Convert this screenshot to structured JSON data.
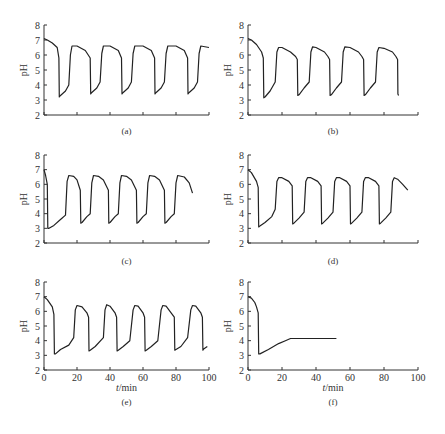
{
  "figure": {
    "panels": [
      "(a)",
      "(b)",
      "(c)",
      "(d)",
      "(e)",
      "(f)"
    ]
  },
  "chart_data": [
    {
      "panel": "(a)",
      "type": "line",
      "title": "",
      "xlabel": "",
      "ylabel": "pH",
      "xlim": [
        0,
        100
      ],
      "ylim": [
        2,
        8
      ],
      "yticks": [
        2,
        3,
        4,
        5,
        6,
        7,
        8
      ],
      "xticks": [
        0,
        20,
        40,
        60,
        80,
        100
      ],
      "xtick_labels_shown": false,
      "layout": {
        "x0": 44,
        "y0": 115,
        "xw": 165,
        "yh": 90,
        "cap_y": 134
      },
      "x": [
        0,
        2,
        5,
        8,
        9,
        9.3,
        10,
        13,
        15,
        16,
        17,
        20,
        25,
        28,
        28.3,
        29,
        32,
        34,
        35,
        36,
        40,
        45,
        47,
        47.3,
        48,
        51,
        53,
        54,
        55,
        60,
        65,
        67,
        67.3,
        68,
        71,
        73,
        74,
        75,
        80,
        85,
        87,
        87.3,
        88,
        91,
        93,
        94,
        95,
        100
      ],
      "values": [
        7.1,
        7.0,
        6.8,
        6.5,
        5.8,
        3.2,
        3.3,
        3.6,
        4.0,
        6.0,
        6.6,
        6.6,
        6.3,
        5.8,
        3.4,
        3.5,
        3.8,
        4.2,
        6.1,
        6.6,
        6.6,
        6.3,
        5.8,
        3.4,
        3.5,
        3.8,
        4.2,
        6.1,
        6.6,
        6.6,
        6.3,
        5.8,
        3.4,
        3.5,
        3.8,
        4.2,
        6.1,
        6.6,
        6.6,
        6.3,
        5.8,
        3.4,
        3.5,
        3.8,
        4.2,
        6.1,
        6.6,
        6.5
      ]
    },
    {
      "panel": "(b)",
      "type": "line",
      "title": "",
      "xlabel": "",
      "ylabel": "pH",
      "xlim": [
        0,
        100
      ],
      "ylim": [
        2,
        8
      ],
      "yticks": [
        2,
        3,
        4,
        5,
        6,
        7,
        8
      ],
      "xticks": [
        0,
        20,
        40,
        60,
        80,
        100
      ],
      "xtick_labels_shown": false,
      "layout": {
        "x0": 248,
        "y0": 115,
        "xw": 170,
        "yh": 90,
        "cap_y": 134
      },
      "x": [
        0,
        2,
        5,
        8,
        9,
        9.3,
        10,
        13,
        16,
        17,
        18,
        20,
        25,
        28,
        29,
        29.3,
        30,
        33,
        36,
        37,
        38,
        40,
        45,
        47,
        48,
        48.3,
        49,
        52,
        55,
        56,
        57,
        60,
        65,
        67,
        68,
        68.3,
        69,
        72,
        75,
        76,
        77,
        80,
        85,
        87,
        88,
        88.2,
        88.6
      ],
      "values": [
        7.1,
        7.0,
        6.7,
        6.2,
        5.8,
        3.15,
        3.2,
        3.6,
        4.2,
        6.2,
        6.5,
        6.5,
        6.2,
        5.9,
        5.7,
        3.3,
        3.35,
        3.8,
        4.2,
        6.2,
        6.55,
        6.5,
        6.2,
        5.9,
        5.7,
        3.3,
        3.35,
        3.8,
        4.2,
        6.2,
        6.55,
        6.5,
        6.2,
        5.9,
        5.7,
        3.3,
        3.35,
        3.8,
        4.2,
        6.2,
        6.5,
        6.45,
        6.2,
        5.9,
        5.7,
        3.4,
        3.3
      ]
    },
    {
      "panel": "(c)",
      "type": "line",
      "title": "",
      "xlabel": "",
      "ylabel": "pH",
      "xlim": [
        0,
        100
      ],
      "ylim": [
        2,
        8
      ],
      "yticks": [
        2,
        3,
        4,
        5,
        6,
        7,
        8
      ],
      "xticks": [
        0,
        20,
        40,
        60,
        80,
        100
      ],
      "xtick_labels_shown": false,
      "layout": {
        "x0": 44,
        "y0": 243,
        "xw": 165,
        "yh": 88,
        "cap_y": 264
      },
      "x": [
        0,
        1,
        2,
        2.3,
        3,
        6,
        10,
        13,
        14,
        15,
        18,
        20,
        22,
        22.3,
        23,
        26,
        28,
        29,
        30,
        33,
        36,
        39,
        39.3,
        40,
        43,
        45,
        46,
        47,
        50,
        53,
        56,
        56.3,
        57,
        60,
        62,
        63,
        64,
        67,
        70,
        73,
        73.3,
        74,
        77,
        79,
        80,
        81,
        85,
        88,
        90
      ],
      "values": [
        7.0,
        6.6,
        6.0,
        3.0,
        3.0,
        3.2,
        3.6,
        3.9,
        6.2,
        6.6,
        6.55,
        6.3,
        5.6,
        3.35,
        3.4,
        3.8,
        4.0,
        6.1,
        6.6,
        6.55,
        6.3,
        5.6,
        3.35,
        3.4,
        3.8,
        4.0,
        6.1,
        6.6,
        6.55,
        6.3,
        5.6,
        3.35,
        3.4,
        3.8,
        4.0,
        6.1,
        6.6,
        6.55,
        6.3,
        5.6,
        3.35,
        3.4,
        3.8,
        4.0,
        6.1,
        6.6,
        6.5,
        6.1,
        5.4
      ]
    },
    {
      "panel": "(d)",
      "type": "line",
      "title": "",
      "xlabel": "",
      "ylabel": "pH",
      "xlim": [
        0,
        100
      ],
      "ylim": [
        2,
        8
      ],
      "yticks": [
        2,
        3,
        4,
        5,
        6,
        7,
        8
      ],
      "xticks": [
        0,
        20,
        40,
        60,
        80,
        100
      ],
      "xtick_labels_shown": false,
      "layout": {
        "x0": 248,
        "y0": 243,
        "xw": 170,
        "yh": 88,
        "cap_y": 264
      },
      "x": [
        0,
        2,
        5,
        6,
        6.3,
        7,
        10,
        14,
        16,
        17,
        18,
        20,
        24,
        26,
        26.3,
        27,
        30,
        33,
        34,
        35,
        37,
        41,
        43,
        43.3,
        44,
        47,
        50,
        51,
        52,
        54,
        58,
        60,
        60.3,
        61,
        64,
        67,
        68,
        69,
        71,
        75,
        77,
        77.3,
        78,
        81,
        84,
        85,
        86,
        88,
        91,
        94
      ],
      "values": [
        7.0,
        6.8,
        6.2,
        5.8,
        3.1,
        3.15,
        3.4,
        3.8,
        4.3,
        6.2,
        6.45,
        6.45,
        6.2,
        5.9,
        3.3,
        3.35,
        3.7,
        4.1,
        6.2,
        6.45,
        6.45,
        6.2,
        5.9,
        3.3,
        3.35,
        3.7,
        4.1,
        6.2,
        6.45,
        6.45,
        6.2,
        5.9,
        3.3,
        3.35,
        3.7,
        4.1,
        6.2,
        6.45,
        6.45,
        6.2,
        5.9,
        3.3,
        3.35,
        3.7,
        4.1,
        6.2,
        6.45,
        6.35,
        6.0,
        5.6
      ]
    },
    {
      "panel": "(e)",
      "type": "line",
      "title": "",
      "xlabel": "t/min",
      "ylabel": "pH",
      "xlim": [
        0,
        100
      ],
      "ylim": [
        2,
        8
      ],
      "yticks": [
        2,
        3,
        4,
        5,
        6,
        7,
        8
      ],
      "xticks": [
        0,
        20,
        40,
        60,
        80,
        100
      ],
      "xtick_labels_shown": true,
      "layout": {
        "x0": 44,
        "y0": 370,
        "xw": 165,
        "yh": 88,
        "cap_y": 405
      },
      "x": [
        0,
        2,
        5,
        6,
        6.3,
        7,
        10,
        15,
        18,
        19,
        20,
        23,
        26,
        27,
        27.3,
        28,
        31,
        36,
        37,
        38,
        40,
        43,
        44,
        44.3,
        45,
        48,
        52,
        54,
        55,
        57,
        60,
        61,
        61.3,
        62,
        65,
        69,
        71,
        72,
        74,
        77,
        79,
        79.3,
        80,
        83,
        87,
        89,
        90,
        92,
        95,
        96,
        96.3,
        97,
        99
      ],
      "values": [
        7.0,
        6.8,
        6.3,
        5.8,
        3.1,
        3.1,
        3.4,
        3.7,
        4.2,
        6.1,
        6.4,
        6.3,
        5.9,
        5.6,
        3.3,
        3.35,
        3.6,
        4.2,
        6.1,
        6.45,
        6.35,
        5.9,
        5.6,
        3.3,
        3.35,
        3.6,
        4.0,
        6.1,
        6.4,
        6.35,
        5.9,
        5.6,
        3.3,
        3.35,
        3.6,
        4.0,
        6.1,
        6.4,
        6.35,
        5.9,
        5.6,
        3.35,
        3.4,
        3.6,
        4.2,
        6.1,
        6.4,
        6.35,
        5.9,
        5.6,
        3.35,
        3.45,
        3.6
      ]
    },
    {
      "panel": "(f)",
      "type": "line",
      "title": "",
      "xlabel": "t/min",
      "ylabel": "pH",
      "xlim": [
        0,
        100
      ],
      "ylim": [
        2,
        8
      ],
      "yticks": [
        2,
        3,
        4,
        5,
        6,
        7,
        8
      ],
      "xticks": [
        0,
        20,
        40,
        60,
        80,
        100
      ],
      "xtick_labels_shown": true,
      "layout": {
        "x0": 248,
        "y0": 370,
        "xw": 170,
        "yh": 88,
        "cap_y": 405
      },
      "x": [
        0,
        2,
        4,
        5,
        6,
        6.3,
        7,
        12,
        18,
        22,
        25,
        26,
        30,
        40,
        52
      ],
      "values": [
        7.0,
        6.9,
        6.6,
        6.3,
        5.9,
        3.1,
        3.1,
        3.4,
        3.8,
        4.0,
        4.15,
        4.15,
        4.15,
        4.15,
        4.15
      ]
    }
  ]
}
